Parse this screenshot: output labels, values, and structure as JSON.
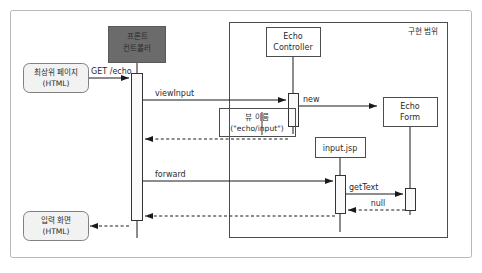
{
  "diagram": {
    "type": "uml-sequence-diagram",
    "title": "",
    "colors": {
      "outer_border": "#b8b8b8",
      "background": "#ffffff",
      "front_controller_fill": "#6b6b6b",
      "front_controller_text": "#ffffff",
      "actor_fill": "#f2f2f2",
      "actor_stroke": "#808080",
      "object_fill": "#ffffff",
      "object_stroke": "#4d4d4d",
      "activation_fill": "#fafafa",
      "activation_stroke": "#333333",
      "line": "#1a1a1a",
      "note_stroke": "#4d4d4d",
      "text": "#2b2b2b",
      "frame_stroke": "#4d4d4d"
    },
    "frame": {
      "label": "구현 범위"
    },
    "participants": [
      {
        "id": "top-page",
        "label_line1": "최상위 페이지",
        "label_line2": "(HTML)",
        "kind": "actor-rounded"
      },
      {
        "id": "front-controller",
        "label_line1": "프론트",
        "label_line2": "컨트롤러",
        "kind": "controller-dark"
      },
      {
        "id": "echo-controller",
        "label_line1": "Echo",
        "label_line2": "Controller",
        "kind": "object"
      },
      {
        "id": "echo-form",
        "label_line1": "Echo",
        "label_line2": "Form",
        "kind": "object"
      },
      {
        "id": "input-jsp",
        "label_line1": "input.jsp",
        "label_line2": "",
        "kind": "object"
      },
      {
        "id": "input-screen",
        "label_line1": "입력 화면",
        "label_line2": "(HTML)",
        "kind": "actor-rounded"
      }
    ],
    "notes": [
      {
        "id": "view-name-note",
        "line1": "뷰 이름",
        "line2": "(\"echo/input\")"
      }
    ],
    "messages": [
      {
        "id": "m1",
        "label": "GET /echo",
        "from": "top-page",
        "to": "front-controller",
        "style": "solid"
      },
      {
        "id": "m2",
        "label": "viewInput",
        "from": "front-controller",
        "to": "echo-controller",
        "style": "solid"
      },
      {
        "id": "m3",
        "label": "new",
        "from": "echo-controller",
        "to": "echo-form",
        "style": "solid"
      },
      {
        "id": "m4",
        "label": "",
        "from": "echo-controller",
        "to": "front-controller",
        "style": "dashed"
      },
      {
        "id": "m5",
        "label": "forward",
        "from": "front-controller",
        "to": "input-jsp",
        "style": "solid"
      },
      {
        "id": "m6",
        "label": "getText",
        "from": "input-jsp",
        "to": "echo-form",
        "style": "solid"
      },
      {
        "id": "m7",
        "label": "null",
        "from": "echo-form",
        "to": "input-jsp",
        "style": "dashed"
      },
      {
        "id": "m8",
        "label": "",
        "from": "input-jsp",
        "to": "front-controller",
        "style": "dashed"
      },
      {
        "id": "m9",
        "label": "",
        "from": "front-controller",
        "to": "input-screen",
        "style": "dashed"
      }
    ]
  }
}
